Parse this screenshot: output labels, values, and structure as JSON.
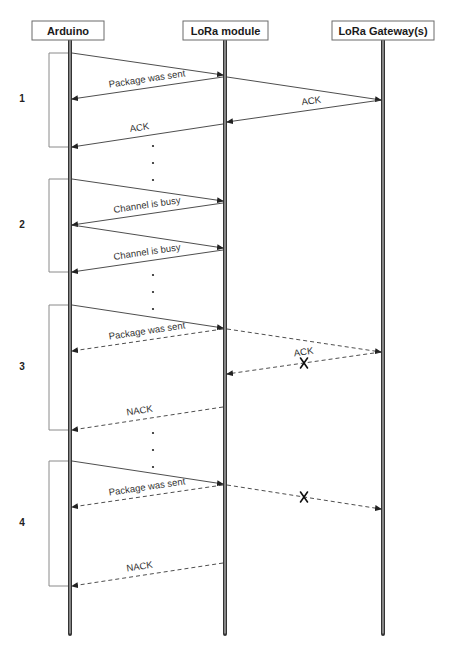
{
  "diagram": {
    "type": "sequence",
    "participants": [
      {
        "id": "arduino",
        "label": "Arduino"
      },
      {
        "id": "module",
        "label": "LoRa module"
      },
      {
        "id": "gateway",
        "label": "LoRa Gateway(s)"
      }
    ],
    "sections": [
      {
        "number": "1",
        "messages": [
          {
            "from": "arduino",
            "to": "module",
            "label": "",
            "style": "solid",
            "lost": false
          },
          {
            "from": "module",
            "to": "arduino",
            "label": "Package was sent",
            "style": "solid",
            "lost": false
          },
          {
            "from": "module",
            "to": "gateway",
            "label": "",
            "style": "solid",
            "lost": false
          },
          {
            "from": "gateway",
            "to": "module",
            "label": "ACK",
            "style": "solid",
            "lost": false
          },
          {
            "from": "module",
            "to": "arduino",
            "label": "ACK",
            "style": "solid",
            "lost": false
          }
        ]
      },
      {
        "number": "2",
        "messages": [
          {
            "from": "arduino",
            "to": "module",
            "label": "",
            "style": "solid",
            "lost": false
          },
          {
            "from": "module",
            "to": "arduino",
            "label": "Channel is busy",
            "style": "solid",
            "lost": false
          },
          {
            "from": "arduino",
            "to": "module",
            "label": "",
            "style": "solid",
            "lost": false
          },
          {
            "from": "module",
            "to": "arduino",
            "label": "Channel is busy",
            "style": "solid",
            "lost": false
          }
        ]
      },
      {
        "number": "3",
        "messages": [
          {
            "from": "arduino",
            "to": "module",
            "label": "",
            "style": "solid",
            "lost": false
          },
          {
            "from": "module",
            "to": "arduino",
            "label": "Package was sent",
            "style": "dashed",
            "lost": false
          },
          {
            "from": "module",
            "to": "gateway",
            "label": "",
            "style": "dashed",
            "lost": false
          },
          {
            "from": "gateway",
            "to": "module",
            "label": "ACK",
            "style": "dashed",
            "lost": true
          },
          {
            "from": "module",
            "to": "arduino",
            "label": "NACK",
            "style": "dashed",
            "lost": false
          }
        ]
      },
      {
        "number": "4",
        "messages": [
          {
            "from": "arduino",
            "to": "module",
            "label": "",
            "style": "solid",
            "lost": false
          },
          {
            "from": "module",
            "to": "arduino",
            "label": "Package was sent",
            "style": "dashed",
            "lost": false
          },
          {
            "from": "module",
            "to": "gateway",
            "label": "",
            "style": "dashed",
            "lost": true
          },
          {
            "from": "module",
            "to": "arduino",
            "label": "NACK",
            "style": "dashed",
            "lost": false
          }
        ]
      }
    ],
    "continuation_marker": "⋮"
  }
}
